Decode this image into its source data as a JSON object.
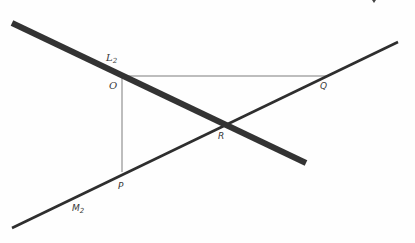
{
  "diagram": {
    "lines": [
      {
        "id": "L2",
        "label": "L",
        "subscript": "2",
        "x1": 12,
        "y1": 23,
        "x2": 306,
        "y2": 163,
        "stroke": "#333333",
        "width": 6
      },
      {
        "id": "M2",
        "label": "M",
        "subscript": "2",
        "x1": 12,
        "y1": 228,
        "x2": 398,
        "y2": 42,
        "stroke": "#2e2e2e",
        "width": 2.6
      }
    ],
    "guides": [
      {
        "id": "OQ",
        "x1": 122,
        "y1": 76,
        "x2": 328,
        "y2": 76,
        "stroke": "#bdbdbd",
        "width": 2
      },
      {
        "id": "OP",
        "x1": 122,
        "y1": 76,
        "x2": 122,
        "y2": 172,
        "stroke": "#bdbdbd",
        "width": 2
      }
    ],
    "points": [
      {
        "name": "O",
        "label": "O"
      },
      {
        "name": "Q",
        "label": "Q"
      },
      {
        "name": "R",
        "label": "R"
      },
      {
        "name": "P",
        "label": "P"
      }
    ],
    "line_labels": {
      "L2_main": "L",
      "L2_sub": "2",
      "M2_main": "M",
      "M2_sub": "2"
    }
  }
}
